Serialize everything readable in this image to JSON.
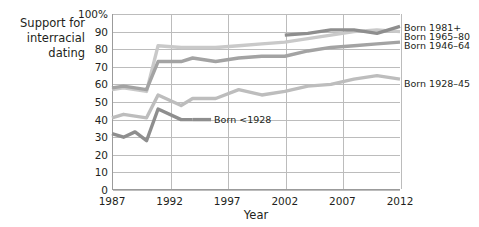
{
  "chart_data": {
    "type": "line",
    "title": "",
    "xlabel": "Year",
    "ylabel": "Support for interracial dating",
    "xlim": [
      1987,
      2012
    ],
    "ylim": [
      0,
      100
    ],
    "grid": true,
    "legend_position": "right-inline",
    "xticks": [
      "1987",
      "1992",
      "1997",
      "2002",
      "2007",
      "2012"
    ],
    "yticks": [
      "0",
      "10",
      "20",
      "30",
      "40",
      "50",
      "60",
      "70",
      "80",
      "90",
      "100%"
    ],
    "ytick_values": [
      0,
      10,
      20,
      30,
      40,
      50,
      60,
      70,
      80,
      90,
      100
    ],
    "xtick_values": [
      1987,
      1992,
      1997,
      2002,
      2007,
      2012
    ],
    "series": [
      {
        "name": "Born 1981+",
        "color": "#8e8e8e",
        "label": "Born 1981+",
        "x": [
          2002,
          2004,
          2006,
          2008,
          2010,
          2012
        ],
        "values": [
          88,
          89,
          91,
          91,
          89,
          93
        ]
      },
      {
        "name": "Born 1965-80",
        "color": "#c9c9c9",
        "label": "Born 1965–80",
        "x": [
          1987,
          1988,
          1989,
          1990,
          1991,
          1993,
          1994,
          1996,
          1998,
          2000,
          2002,
          2004,
          2006,
          2008,
          2010,
          2012
        ],
        "values": [
          57,
          58,
          57,
          56,
          82,
          81,
          81,
          81,
          82,
          83,
          84,
          86,
          88,
          90,
          91,
          90
        ]
      },
      {
        "name": "Born 1946-64",
        "color": "#a3a3a3",
        "label": "Born 1946–64",
        "x": [
          1987,
          1988,
          1989,
          1990,
          1991,
          1993,
          1994,
          1996,
          1998,
          2000,
          2002,
          2004,
          2006,
          2008,
          2010,
          2012
        ],
        "values": [
          58,
          59,
          58,
          57,
          73,
          73,
          75,
          73,
          75,
          76,
          76,
          79,
          81,
          82,
          83,
          84
        ]
      },
      {
        "name": "Born 1928-45",
        "color": "#bdbdbd",
        "label": "Born 1928–45",
        "x": [
          1987,
          1988,
          1989,
          1990,
          1991,
          1993,
          1994,
          1996,
          1998,
          2000,
          2002,
          2004,
          2006,
          2008,
          2010,
          2012
        ],
        "values": [
          41,
          43,
          42,
          41,
          54,
          48,
          52,
          52,
          57,
          54,
          56,
          59,
          60,
          63,
          65,
          63
        ]
      },
      {
        "name": "Born <1928",
        "color": "#8e8e8e",
        "label": "Born <1928",
        "x": [
          1987,
          1988,
          1989,
          1990,
          1991,
          1993,
          1994
        ],
        "values": [
          32,
          30,
          33,
          28,
          46,
          40,
          40
        ]
      }
    ],
    "annotations": [
      {
        "text": "Born <1928",
        "x": 1995.6,
        "y": 40
      }
    ]
  },
  "axis_caption": {
    "y_line1": "Support for",
    "y_line2": "interracial",
    "y_line3": "dating",
    "x_label": "Year"
  }
}
